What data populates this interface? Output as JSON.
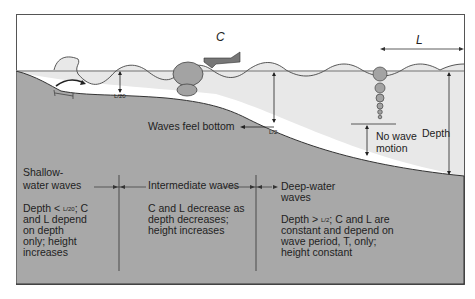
{
  "diagram": {
    "symbols": {
      "celerity": "C",
      "wavelength": "L",
      "l_over_20": "L/20",
      "l_over_2": "L/2"
    },
    "labels": {
      "waves_feel_bottom": "Waves feel bottom",
      "no_wave_motion_1": "No wave",
      "no_wave_motion_2": "motion",
      "depth": "Depth"
    },
    "zones": [
      {
        "name_1": "Shallow-",
        "name_2": "water waves",
        "desc_pre": "Depth <",
        "desc_frac": "L/20",
        "desc_1": "; C",
        "desc_2": "and L depend",
        "desc_3": "on depth",
        "desc_4": "only; height",
        "desc_5": "increases"
      },
      {
        "name_1": "Intermediate waves",
        "desc_1": "C and L decrease as",
        "desc_2": "depth decreases;",
        "desc_3": "height increases"
      },
      {
        "name_1": "Deep-water",
        "name_2": "waves",
        "desc_pre": "Depth >",
        "desc_frac": "L/2",
        "desc_1": "; C and L are",
        "desc_2": "constant and depend on",
        "desc_3": "wave period, T, only;",
        "desc_4": "height constant"
      }
    ],
    "colors": {
      "seabed": "#a9a9a9",
      "water": "#e6e6e6",
      "orbit_fill": "#a0a0a0",
      "line": "#333333",
      "background": "#ffffff"
    }
  }
}
